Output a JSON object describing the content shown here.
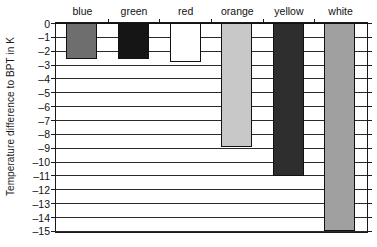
{
  "chart_data": {
    "type": "bar",
    "title": "",
    "subtitle": "",
    "xlabel": "",
    "ylabel": "Temperature difference to BPT in K",
    "categories": [
      "blue",
      "green",
      "red",
      "orange",
      "yellow",
      "white"
    ],
    "values": [
      -2.6,
      -2.6,
      -2.85,
      -8.95,
      -11.05,
      -15.0
    ],
    "series": [
      {
        "name": "Temperature difference to BPT",
        "values": [
          -2.6,
          -2.6,
          -2.85,
          -8.95,
          -11.05,
          -15.0
        ]
      }
    ],
    "bar_fills": [
      "#6e6e6e",
      "#151515",
      "#ffffff",
      "#c8c8c8",
      "#2e2e2e",
      "#a0a0a0"
    ],
    "bar_edge_color": "#111111",
    "ylim": [
      -15,
      0
    ],
    "ytick_values": [
      0,
      -1,
      -2,
      -3,
      -4,
      -5,
      -6,
      -7,
      -8,
      -9,
      -10,
      -11,
      -12,
      -13,
      -14,
      -15
    ],
    "ytick_labels": [
      "0",
      "–1",
      "–2",
      "–3",
      "–4",
      "–5",
      "–6",
      "–7",
      "–8",
      "–9",
      "–10",
      "–11",
      "–12",
      "–13",
      "–14",
      "–15"
    ],
    "grid": true,
    "grid_axis": "y",
    "legend": false,
    "legend_position": "none",
    "category_labels_position": "above-axis",
    "axis_color": "#1a1a1a",
    "grid_color": "#2b2b2b",
    "background_color": "#ffffff"
  }
}
